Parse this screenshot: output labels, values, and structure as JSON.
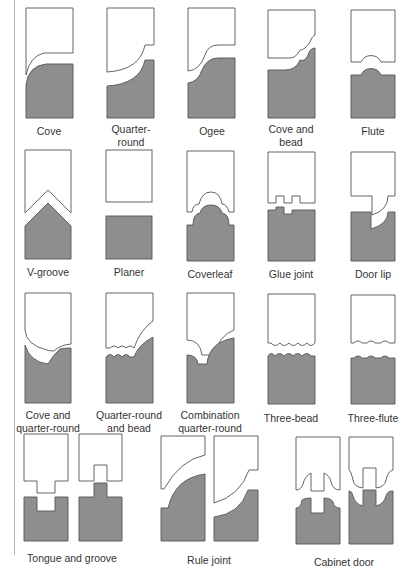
{
  "figure": {
    "colors": {
      "cutter": "#ffffff",
      "workpiece": "#8e8e8e",
      "outline": "#555555"
    },
    "profiles": [
      {
        "label": "Cove"
      },
      {
        "label": "Quarter-\nround"
      },
      {
        "label": "Ogee"
      },
      {
        "label": "Cove and\nbead"
      },
      {
        "label": "Flute"
      },
      {
        "label": "V-groove"
      },
      {
        "label": "Planer"
      },
      {
        "label": "Coverleaf"
      },
      {
        "label": "Glue joint"
      },
      {
        "label": "Door lip"
      },
      {
        "label": "Cove and\nquarter-round"
      },
      {
        "label": "Quarter-round\nand bead"
      },
      {
        "label": "Combination\nquarter-round"
      },
      {
        "label": "Three-bead"
      },
      {
        "label": "Three-flute"
      },
      {
        "label": "Tongue and groove"
      },
      {
        "label": "Rule joint"
      },
      {
        "label": "Cabinet door"
      }
    ]
  }
}
